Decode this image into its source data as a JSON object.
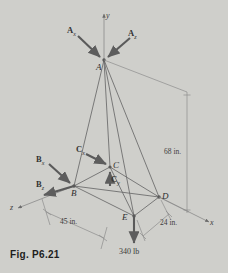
{
  "figure": {
    "caption": "Fig. P6.21",
    "type": "3d-space-frame-free-body-diagram"
  },
  "axes": [
    {
      "name": "y",
      "label": "y"
    },
    {
      "name": "x",
      "label": "x"
    },
    {
      "name": "z",
      "label": "z"
    }
  ],
  "nodes": [
    {
      "id": "A",
      "label": "A"
    },
    {
      "id": "B",
      "label": "B"
    },
    {
      "id": "C",
      "label": "C"
    },
    {
      "id": "D",
      "label": "D"
    },
    {
      "id": "E",
      "label": "E"
    }
  ],
  "forces": [
    {
      "name": "A-x",
      "base": "A",
      "sub": "x"
    },
    {
      "name": "A-z",
      "base": "A",
      "sub": "z"
    },
    {
      "name": "B-x",
      "base": "B",
      "sub": "x"
    },
    {
      "name": "B-z",
      "base": "B",
      "sub": "z"
    },
    {
      "name": "C-x",
      "base": "C",
      "sub": "x"
    },
    {
      "name": "C-y",
      "base": "C",
      "sub": "y"
    }
  ],
  "dimensions": [
    {
      "name": "height",
      "value": "68 in."
    },
    {
      "name": "depth",
      "value": "45 in."
    },
    {
      "name": "width",
      "value": "24 in."
    }
  ],
  "load": {
    "at": "E",
    "value": "340 lb"
  },
  "colors": {
    "background": "#cfcfcb",
    "line": "#6e6e6e",
    "arrow": "#5a5a5a",
    "text": "#3a3a3a"
  }
}
